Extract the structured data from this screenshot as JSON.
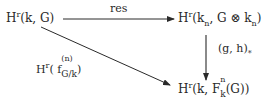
{
  "diagram": {
    "type": "commutative-diagram",
    "nodes": {
      "top_left": {
        "H": "H",
        "sup": "r",
        "args": "(k, G)"
      },
      "top_right": {
        "H": "H",
        "sup": "r",
        "open": "(k",
        "sub1": "n",
        "mid": ", G ⊗ k",
        "sub2": "n",
        "close": ")"
      },
      "bottom_right": {
        "H": "H",
        "sup": "r",
        "open": "(k, F",
        "sup_n": "n",
        "sub_k": "k",
        "close": "(G))"
      }
    },
    "edges": {
      "horizontal": {
        "from": "top_left",
        "to": "top_right",
        "label": "res"
      },
      "vertical": {
        "from": "top_right",
        "to": "bottom_right",
        "label_main": "(g, h)",
        "label_sub": "*"
      },
      "diagonal": {
        "from": "top_left",
        "to": "bottom_right",
        "label_H": "H",
        "label_sup": "r",
        "label_open": "( f",
        "label_stack_up": "(n)",
        "label_stack_down": "G/k",
        "label_close": ")"
      }
    },
    "colors": {
      "ink": "#2a2a2a",
      "background": "#ffffff"
    }
  }
}
